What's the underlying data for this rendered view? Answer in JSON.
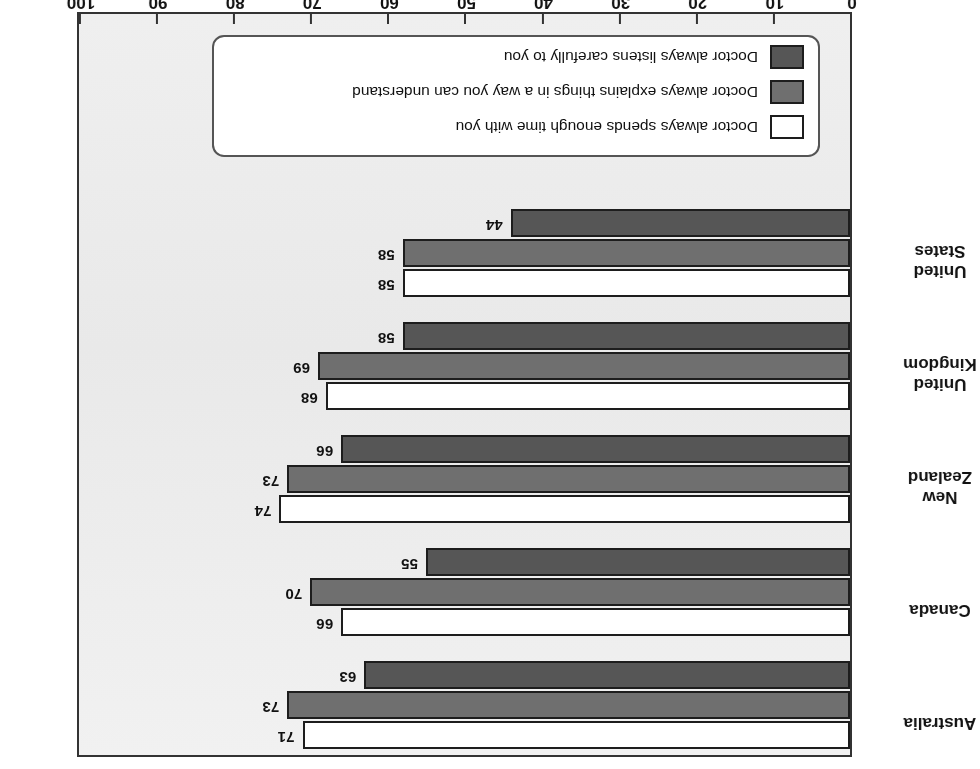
{
  "chart_data": {
    "type": "bar",
    "orientation": "horizontal",
    "title": "",
    "subtitle": "",
    "xlabel": "% respondents",
    "ylabel": "",
    "ylim": [
      0,
      100
    ],
    "xlim": [
      0,
      100
    ],
    "grid": false,
    "legend_position": "bottom-left",
    "axis_tick_labels": [
      "0",
      "10",
      "20",
      "30",
      "40",
      "50",
      "60",
      "70",
      "80",
      "90",
      "100"
    ],
    "axis_ticks": [
      0,
      10,
      20,
      30,
      40,
      50,
      60,
      70,
      80,
      90,
      100
    ],
    "categories": [
      "Australia",
      "Canada",
      "New Zealand",
      "United Kingdom",
      "United States"
    ],
    "series": [
      {
        "name": "Doctor always listens carefully to you",
        "color": "#565656",
        "values": [
          71,
          66,
          74,
          68,
          58
        ]
      },
      {
        "name": "Doctor always explains things in a way you can understand",
        "color": "#6f6f6f",
        "values": [
          73,
          70,
          73,
          69,
          58
        ]
      },
      {
        "name": "Doctor always spends enough time with you",
        "color": "#ffffff",
        "values": [
          63,
          55,
          66,
          58,
          44
        ]
      }
    ]
  },
  "legend": {
    "items": [
      {
        "label": "Doctor always spends enough time with you",
        "swatch": "s0"
      },
      {
        "label": "Doctor always explains things in a way you can understand",
        "swatch": "s1"
      },
      {
        "label": "Doctor always listens carefully to you",
        "swatch": "s2"
      }
    ]
  },
  "axis": {
    "value_title": "% respondents"
  }
}
